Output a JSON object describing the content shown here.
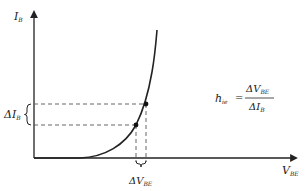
{
  "diagram": {
    "y_axis": {
      "label": "I",
      "subscript": "B"
    },
    "x_axis": {
      "label": "V",
      "subscript": "BE"
    },
    "delta_ib": {
      "prefix": "ΔI",
      "subscript": "B"
    },
    "delta_vbe": {
      "prefix": "ΔV",
      "subscript": "BE"
    },
    "formula": {
      "lhs": "h",
      "lhs_subscript": "ie",
      "equals": "=",
      "numerator": "ΔV",
      "numerator_subscript": "BE",
      "denominator": "ΔI",
      "denominator_subscript": "B"
    },
    "colors": {
      "ink": "#222222",
      "dashed": "#555555",
      "background": "#ffffff"
    }
  }
}
